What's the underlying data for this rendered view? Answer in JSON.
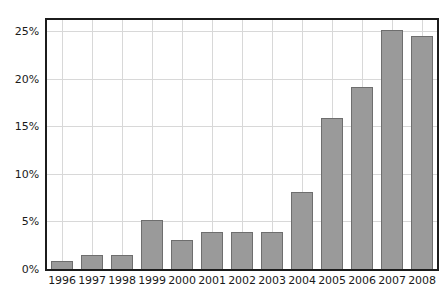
{
  "chart_data": {
    "type": "bar",
    "title": "",
    "subtitle": "",
    "xlabel": "",
    "ylabel": "",
    "categories": [
      "1996",
      "1997",
      "1998",
      "1999",
      "2000",
      "2001",
      "2002",
      "2003",
      "2004",
      "2005",
      "2006",
      "2007",
      "2008"
    ],
    "values": [
      0.8,
      1.5,
      1.5,
      5.2,
      3.1,
      3.9,
      3.9,
      3.9,
      8.1,
      15.9,
      19.2,
      25.1,
      24.5
    ],
    "value_unit": "%",
    "ylim": [
      0,
      26.2
    ],
    "y_ticks": [
      0,
      5,
      10,
      15,
      20,
      25
    ],
    "y_tick_labels": [
      "0%",
      "5%",
      "10%",
      "15%",
      "20%",
      "25%"
    ],
    "grid": {
      "horizontal": true,
      "vertical": true
    },
    "legend": {
      "visible": false,
      "position": "none",
      "entries": []
    },
    "annotations": [],
    "colors": {
      "bar_fill": "#9a9a9a",
      "bar_border": "#6e6e6e",
      "gridline": "#d8d8d8",
      "axis_frame": "#1c1c1c",
      "tick_label": "#1a1a1a",
      "background": "#ffffff"
    }
  }
}
